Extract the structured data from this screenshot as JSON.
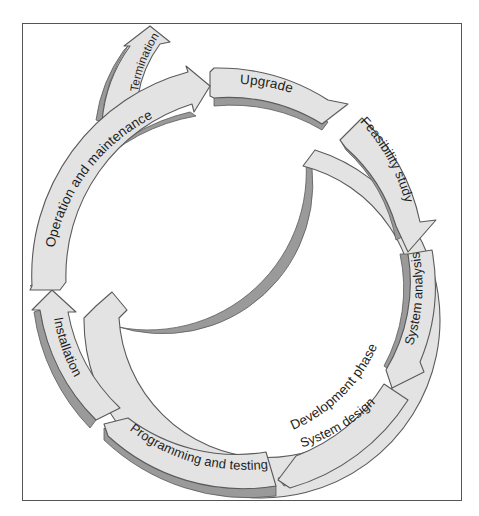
{
  "diagram": {
    "type": "cycle",
    "colors": {
      "arrow_fill": "#e3e3e3",
      "arrow_shadow": "#9a9a9a",
      "arrow_stroke": "#5a5a5a",
      "frame_border": "#555555",
      "text": "#1e1e1e",
      "background": "#ffffff"
    },
    "outer_cycle": [
      {
        "id": "upgrade",
        "label": "Upgrade"
      },
      {
        "id": "feasibility-study",
        "label": "Feasibility study"
      },
      {
        "id": "system-analysis",
        "label": "System analysis"
      },
      {
        "id": "system-design",
        "label": "System design"
      },
      {
        "id": "programming-and-testing",
        "label": "Programming and testing"
      },
      {
        "id": "installation",
        "label": "Installation"
      },
      {
        "id": "operation-and-maintenance",
        "label": "Operation and maintenance"
      }
    ],
    "branch": {
      "id": "termination",
      "label": "Termination"
    },
    "inner_phase": {
      "id": "development-phase",
      "label": "Development phase"
    }
  }
}
